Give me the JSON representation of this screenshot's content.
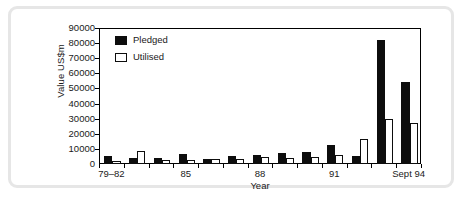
{
  "chart_data": {
    "type": "bar",
    "title": "",
    "xlabel": "Year",
    "ylabel": "Value US$m",
    "ylim": [
      0,
      90000
    ],
    "yticks": [
      0,
      10000,
      20000,
      30000,
      40000,
      50000,
      60000,
      70000,
      80000,
      90000
    ],
    "ytick_labels": [
      "0",
      "10000",
      "20000",
      "30000",
      "40000",
      "50000",
      "60000",
      "70000",
      "80000",
      "90000"
    ],
    "grid": false,
    "legend_position": "top-left",
    "categories": [
      "79–82",
      "83",
      "84",
      "85",
      "86",
      "87",
      "88",
      "89",
      "90",
      "91",
      "92",
      "93",
      "Sept 94"
    ],
    "xtick_labels": [
      "79–82",
      "85",
      "88",
      "91",
      "Sept 94"
    ],
    "xtick_categories": [
      "79–82",
      "85",
      "88",
      "91",
      "Sept 94"
    ],
    "series": [
      {
        "name": "Pledged",
        "color": "#0d0d0d",
        "values": [
          5500,
          4000,
          4000,
          6500,
          3300,
          5000,
          5800,
          7000,
          7800,
          12500,
          5500,
          82000,
          54000
        ]
      },
      {
        "name": "Utilised",
        "color": "#ffffff",
        "values": [
          2300,
          8600,
          2600,
          2500,
          3500,
          3600,
          4500,
          4200,
          4500,
          6000,
          16500,
          30000,
          27000
        ]
      }
    ]
  },
  "legend": {
    "items": [
      {
        "label": "Pledged",
        "style": "filled"
      },
      {
        "label": "Utilised",
        "style": "hollow"
      }
    ]
  },
  "axes": {
    "x_title": "Year",
    "y_title": "Value US$m"
  },
  "colors": {
    "pledged": "#0d0d0d",
    "utilised": "#ffffff",
    "axis": "#000000",
    "frame": "#e6e6e6",
    "background": "#ffffff"
  }
}
